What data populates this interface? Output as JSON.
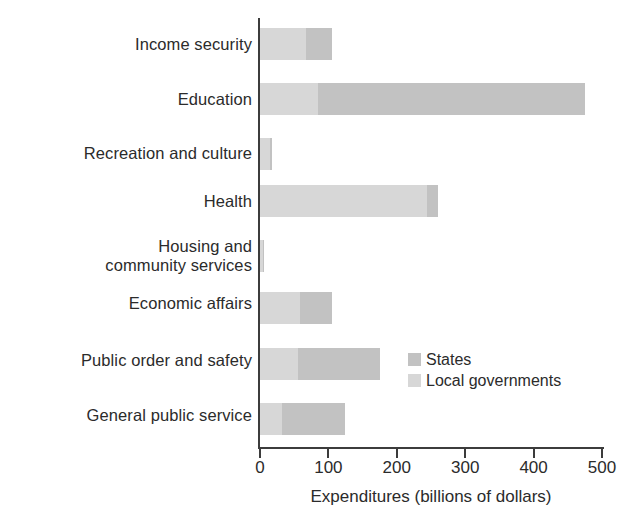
{
  "chart_data": {
    "type": "bar",
    "orientation": "horizontal",
    "stacked": true,
    "title": "",
    "xlabel": "Expenditures (billions of dollars)",
    "ylabel": "",
    "xlim": [
      0,
      500
    ],
    "xticks": [
      0,
      100,
      200,
      300,
      400,
      500
    ],
    "xtick_labels": [
      "0",
      "100",
      "200",
      "300",
      "400",
      "500"
    ],
    "grid": false,
    "legend_position": "inside-right",
    "categories": [
      "Income security",
      "Education",
      "Recreation and culture",
      "Housing and\ncommunity services",
      "Health",
      "Economic affairs",
      "Public order and safety",
      "General public service"
    ],
    "category_order_top_to_bottom": [
      "Income security",
      "Education",
      "Recreation and culture",
      "Health",
      "Housing and community services",
      "Economic affairs",
      "Public order and safety",
      "General public service"
    ],
    "series": [
      {
        "name": "Local governments",
        "color": "#d7d7d7",
        "values": [
          67,
          85,
          14,
          244,
          4,
          58,
          55,
          32
        ]
      },
      {
        "name": "States",
        "color": "#c2c2c2",
        "values": [
          38,
          390,
          3,
          16,
          1,
          47,
          120,
          92
        ]
      }
    ],
    "totals": [
      105,
      475,
      17,
      260,
      5,
      105,
      175,
      124
    ]
  },
  "axis": {
    "tick_values": [
      "0",
      "100",
      "200",
      "300",
      "400",
      "500"
    ],
    "x_title": "Expenditures (billions of dollars)"
  },
  "categories": [
    {
      "line1": "Income security",
      "line2": ""
    },
    {
      "line1": "Education",
      "line2": ""
    },
    {
      "line1": "Recreation and culture",
      "line2": ""
    },
    {
      "line1": "Health",
      "line2": ""
    },
    {
      "line1": "Housing and",
      "line2": "community services"
    },
    {
      "line1": "Economic affairs",
      "line2": ""
    },
    {
      "line1": "Public order and safety",
      "line2": ""
    },
    {
      "line1": "General public service",
      "line2": ""
    }
  ],
  "legend": {
    "items": [
      {
        "label": "States",
        "color": "#c2c2c2"
      },
      {
        "label": "Local governments",
        "color": "#d7d7d7"
      }
    ]
  },
  "colors": {
    "states": "#c2c2c2",
    "local_governments": "#d7d7d7",
    "axis": "#3c3c3c",
    "text": "#2b2b2b",
    "background": "#ffffff"
  }
}
